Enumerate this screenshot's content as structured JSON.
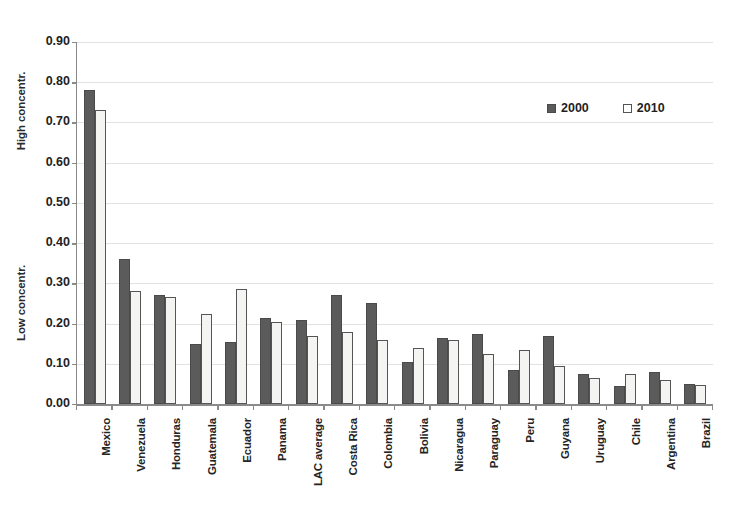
{
  "chart_data": {
    "type": "bar",
    "title": "",
    "xlabel": "",
    "ylabel": "",
    "ylim": [
      0.0,
      0.9
    ],
    "ytick_labels": [
      "0.90",
      "0.80",
      "0.70",
      "0.60",
      "0.50",
      "0.40",
      "0.30",
      "0.20",
      "0.10",
      "0.00"
    ],
    "ytick_values": [
      0.9,
      0.8,
      0.7,
      0.6,
      0.5,
      0.4,
      0.3,
      0.2,
      0.1,
      0.0
    ],
    "grid": true,
    "legend_position": "top-right",
    "axis_annotations": {
      "high": "High concentr.",
      "low": "Low concentr."
    },
    "categories": [
      "Mexico",
      "Venezuela",
      "Honduras",
      "Guatemala",
      "Ecuador",
      "Panama",
      "LAC average",
      "Costa Rica",
      "Colombia",
      "Bolivia",
      "Nicaragua",
      "Paraguay",
      "Peru",
      "Guyana",
      "Uruguay",
      "Chile",
      "Argentina",
      "Brazil"
    ],
    "series": [
      {
        "name": "2000",
        "color": "#5b5b5b",
        "values": [
          0.78,
          0.36,
          0.27,
          0.15,
          0.155,
          0.215,
          0.21,
          0.27,
          0.25,
          0.105,
          0.165,
          0.175,
          0.085,
          0.17,
          0.075,
          0.045,
          0.08,
          0.05
        ]
      },
      {
        "name": "2010",
        "color": "#ffffff",
        "values": [
          0.73,
          0.28,
          0.265,
          0.225,
          0.285,
          0.205,
          0.17,
          0.18,
          0.16,
          0.14,
          0.16,
          0.125,
          0.135,
          0.095,
          0.065,
          0.075,
          0.06,
          0.048
        ]
      }
    ]
  },
  "legend": {
    "entries": [
      {
        "label": "2000",
        "swatch": "filled-square-icon"
      },
      {
        "label": "2010",
        "swatch": "open-square-icon"
      }
    ]
  }
}
